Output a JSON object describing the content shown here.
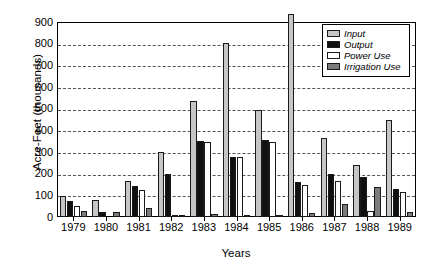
{
  "chart_data": {
    "type": "bar",
    "title": "",
    "xlabel": "Years",
    "ylabel": "Acre-Feet (thousands)",
    "categories": [
      "1979",
      "1980",
      "1981",
      "1982",
      "1983",
      "1984",
      "1985",
      "1986",
      "1987",
      "1988",
      "1989"
    ],
    "ylim": [
      0,
      900
    ],
    "ytick_step": 100,
    "yticks": [
      "900",
      "800",
      "700",
      "600",
      "500",
      "400",
      "300",
      "200",
      "100",
      "0"
    ],
    "grid": "horizontal-dashed",
    "legend_position": "top-right-inside",
    "series": [
      {
        "name": "Input",
        "color": "#c6c6c6",
        "values": [
          95,
          80,
          165,
          300,
          535,
          805,
          495,
          935,
          365,
          240,
          450
        ]
      },
      {
        "name": "Output",
        "color": "#101010",
        "values": [
          75,
          25,
          145,
          200,
          350,
          275,
          355,
          160,
          200,
          185,
          130
        ]
      },
      {
        "name": "Power Use",
        "color": "#ffffff",
        "values": [
          50,
          0,
          125,
          10,
          345,
          275,
          345,
          150,
          165,
          30,
          115
        ]
      },
      {
        "name": "Irrigation Use",
        "color": "#7c7c7c",
        "values": [
          30,
          25,
          40,
          5,
          15,
          5,
          10,
          20,
          60,
          140,
          25
        ]
      }
    ]
  },
  "legend": {
    "items": [
      {
        "label": "Input"
      },
      {
        "label": "Output"
      },
      {
        "label": "Power Use"
      },
      {
        "label": "Irrigation Use"
      }
    ]
  }
}
